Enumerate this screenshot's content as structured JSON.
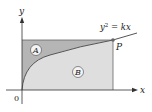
{
  "diagram": {
    "type": "area-regions",
    "axes": {
      "x_label": "x",
      "y_label": "y",
      "origin_label": "0"
    },
    "curve": {
      "equation_lhs": "y",
      "equation_exp": "2",
      "equation_rhs": " = kx"
    },
    "point": {
      "label": "P"
    },
    "regions": [
      {
        "label": "A",
        "description": "region above curve, below horizontal line through P",
        "color": "#b5b5b5"
      },
      {
        "label": "B",
        "description": "region below curve, above x-axis, left of vertical line through P",
        "color": "#dedede"
      }
    ],
    "colors": {
      "axis": "#333333",
      "curve": "#555555",
      "outline": "#666666",
      "point": "#666666"
    }
  }
}
